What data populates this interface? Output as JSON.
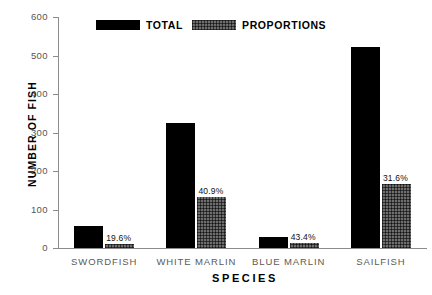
{
  "chart_data": {
    "type": "bar",
    "title": "",
    "xlabel": "SPECIES",
    "ylabel": "NUMBER OF FISH",
    "categories": [
      "SWORDFISH",
      "WHITE MARLIN",
      "BLUE MARLIN",
      "SAILFISH"
    ],
    "series": [
      {
        "name": "TOTAL",
        "values": [
          57,
          324,
          28,
          522
        ],
        "color": "#000000"
      },
      {
        "name": "PROPORTIONS",
        "values": [
          11,
          133,
          12,
          165
        ],
        "color": "#6e6e6e"
      }
    ],
    "point_labels": [
      "19.6%",
      "40.9%",
      "43.4%",
      "31.6%"
    ],
    "ylim": [
      0,
      600
    ],
    "yticks": [
      0,
      100,
      200,
      300,
      400,
      500,
      600
    ],
    "ytick_labels": [
      "0",
      "100",
      "200",
      "300",
      "400",
      "500",
      "600"
    ],
    "grid": false,
    "legend_position": "top-center",
    "legend": [
      "TOTAL",
      "PROPORTIONS"
    ]
  },
  "axes": {
    "y_title": "NUMBER OF FISH",
    "x_title": "SPECIES"
  },
  "legend": {
    "total_label": "TOTAL",
    "proportions_label": "PROPORTIONS"
  }
}
